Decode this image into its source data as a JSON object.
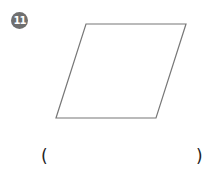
{
  "problem": {
    "number": "11",
    "shape": "parallelogram",
    "vertices": [
      [
        86,
        24
      ],
      [
        186,
        24
      ],
      [
        156,
        118
      ],
      [
        56,
        118
      ]
    ],
    "stroke_color": "#777777",
    "answer_open": "(",
    "answer_close": ")",
    "answer_value": ""
  }
}
